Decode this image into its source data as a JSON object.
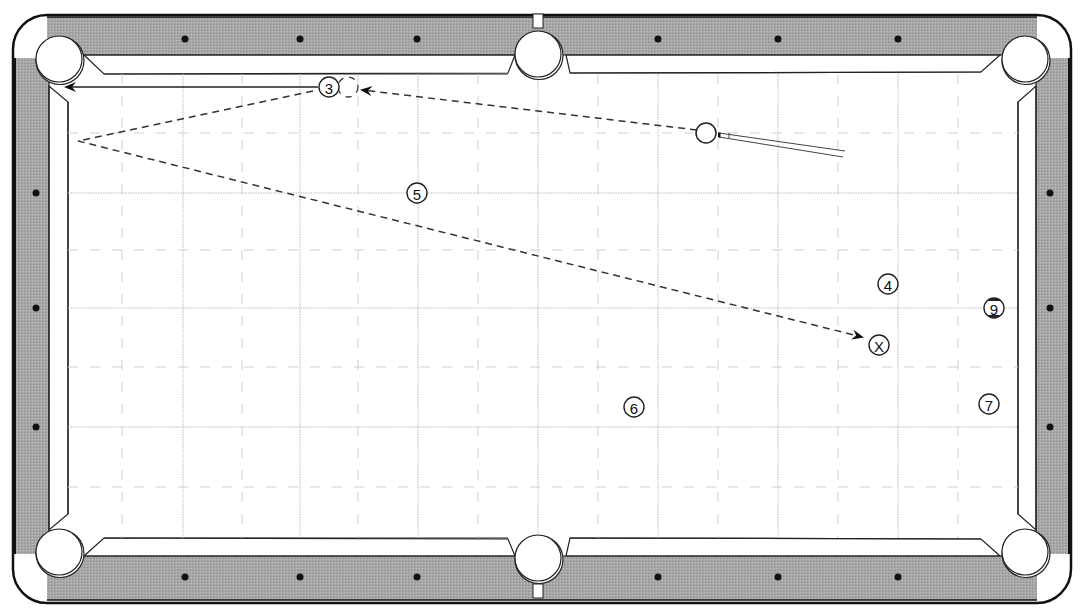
{
  "diagram": {
    "type": "billiards-shot-diagram",
    "colors": {
      "rail": "#a9a9a9",
      "cushion": "#ffffff",
      "cloth": "#ffffff",
      "outline": "#111111",
      "grid": "#b5b5b5",
      "path": "#333333"
    },
    "balls": [
      {
        "id": "ball-3",
        "label": "3",
        "x": 329,
        "y": 87
      },
      {
        "id": "ball-5",
        "label": "5",
        "x": 417,
        "y": 193
      },
      {
        "id": "ball-4",
        "label": "4",
        "x": 888,
        "y": 284
      },
      {
        "id": "ball-9",
        "label": "9",
        "x": 994,
        "y": 308,
        "striped": true
      },
      {
        "id": "ball-6",
        "label": "6",
        "x": 634,
        "y": 407
      },
      {
        "id": "ball-7",
        "label": "7",
        "x": 989,
        "y": 404
      }
    ],
    "target_marker": {
      "label": "X",
      "x": 879,
      "y": 345
    },
    "cue_ball": {
      "x": 706,
      "y": 133
    },
    "ghost_ball": {
      "x": 348,
      "y": 87
    },
    "cue_stick": {
      "tip_x": 719,
      "tip_y": 135,
      "butt_x": 845,
      "butt_y": 155
    },
    "paths": {
      "cue_ball_path": {
        "from": [
          697,
          130
        ],
        "to": [
          362,
          90
        ],
        "style": "dashed"
      },
      "object_ball_path": {
        "from": [
          318,
          87
        ],
        "to": [
          66,
          87
        ],
        "style": "solid"
      },
      "cue_ball_after": [
        [
          313,
          91
        ],
        [
          78,
          141
        ],
        [
          862,
          337
        ]
      ]
    },
    "pockets": [
      {
        "name": "top-left",
        "x": 59,
        "y": 59
      },
      {
        "name": "top-middle",
        "x": 538,
        "y": 54
      },
      {
        "name": "top-right",
        "x": 1025,
        "y": 59
      },
      {
        "name": "bottom-left",
        "x": 59,
        "y": 552
      },
      {
        "name": "bottom-middle",
        "x": 538,
        "y": 558
      },
      {
        "name": "bottom-right",
        "x": 1025,
        "y": 552
      }
    ],
    "diamonds_top": [
      185,
      300,
      417,
      658,
      778,
      898
    ],
    "diamonds_bottom": [
      185,
      300,
      417,
      658,
      778,
      898
    ],
    "diamonds_left": [
      193,
      308,
      427
    ],
    "diamonds_right": [
      193,
      308,
      427
    ]
  }
}
